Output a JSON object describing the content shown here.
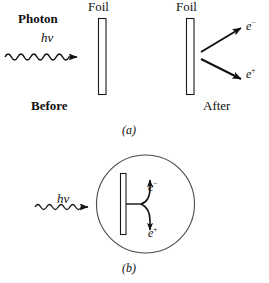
{
  "figure": {
    "panel_a": {
      "caption": "(a)",
      "photon_label": "Photon",
      "energy_label": "hν",
      "foil_label_left": "Foil",
      "foil_label_right": "Foil",
      "before_label": "Before",
      "after_label": "After",
      "electron_label": "e",
      "electron_charge": "−",
      "positron_label": "e",
      "positron_charge": "+"
    },
    "panel_b": {
      "caption": "(b)",
      "energy_label": "hν",
      "electron_label": "e",
      "electron_charge": "−",
      "positron_label": "e",
      "positron_charge": "+"
    }
  },
  "colors": {
    "ink": "#111111",
    "foil_stroke": "#1a1a1a",
    "circle_stroke": "#4a4a4a",
    "background": "#ffffff"
  }
}
